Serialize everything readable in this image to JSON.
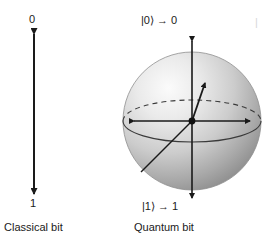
{
  "figure": {
    "background_color": "#ffffff",
    "ink_color": "#1a1a1a"
  },
  "classical": {
    "top_label": "0",
    "bottom_label": "1",
    "caption": "Classical bit"
  },
  "quantum": {
    "top_label": "|0⟩ → 0",
    "bottom_label": "|1⟩ → 1",
    "caption": "Quantum bit"
  },
  "edge": {
    "clipped_fragment": "|"
  },
  "sphere": {
    "fill_light": "#f2f2f2",
    "fill_mid": "#c9c9c9",
    "fill_dark": "#8f8f8f",
    "outline_color": "#8a8a8a"
  }
}
